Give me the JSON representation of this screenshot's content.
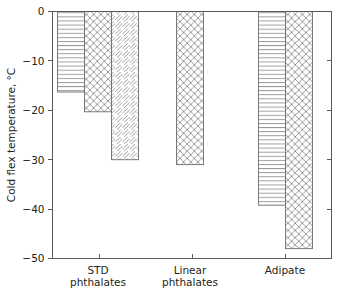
{
  "chart_data": {
    "type": "bar",
    "title": "",
    "xlabel": "",
    "ylabel": "Cold flex temperature, °C",
    "categories": [
      "STD\nphthalates",
      "Linear\nphthalates",
      "Adipate"
    ],
    "category_labels": [
      [
        "STD",
        "phthalates"
      ],
      [
        "Linear",
        "phthalates"
      ],
      [
        "Adipate"
      ]
    ],
    "ylim": [
      -50,
      0
    ],
    "yticks": [
      0,
      -10,
      -20,
      -30,
      -40,
      -50
    ],
    "ytick_labels": [
      "0",
      "−10",
      "−20",
      "−30",
      "−40",
      "−50"
    ],
    "grid": false,
    "legend": "none",
    "series": [
      {
        "name": "horizontal-hatch",
        "pattern": "horizontal-lines",
        "values": [
          -16.3,
          null,
          -39.2
        ]
      },
      {
        "name": "cross-hatch",
        "pattern": "diagonal-crosshatch",
        "values": [
          -20.3,
          -31.0,
          -48.0
        ]
      },
      {
        "name": "diagonal-hatch",
        "pattern": "diagonal-lines",
        "values": [
          -30.0,
          null,
          null
        ]
      }
    ],
    "bars": [
      {
        "group": "STD phthalates",
        "pattern": "horizontal-lines",
        "value": -16.3
      },
      {
        "group": "STD phthalates",
        "pattern": "diagonal-crosshatch",
        "value": -20.3
      },
      {
        "group": "STD phthalates",
        "pattern": "diagonal-lines",
        "value": -30.0
      },
      {
        "group": "Linear phthalates",
        "pattern": "diagonal-crosshatch",
        "value": -31.0
      },
      {
        "group": "Adipate",
        "pattern": "horizontal-lines",
        "value": -39.2
      },
      {
        "group": "Adipate",
        "pattern": "diagonal-crosshatch",
        "value": -48.0
      }
    ]
  },
  "colors": {
    "axis": "#58595b",
    "bar_stroke": "#6d6e71",
    "hatch": "#8c8c8c",
    "text": "#231f20",
    "background": "#ffffff"
  }
}
